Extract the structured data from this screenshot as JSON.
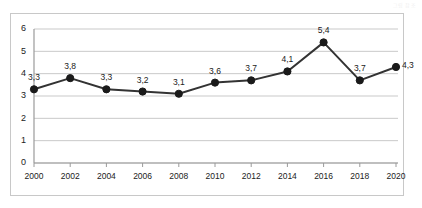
{
  "corner_note": {
    "text": "그림 참조"
  },
  "chart_data": {
    "type": "line",
    "title": "",
    "subtitle": "",
    "xlabel": "",
    "ylabel": "",
    "categories": [
      "2000",
      "2002",
      "2004",
      "2006",
      "2008",
      "2010",
      "2012",
      "2014",
      "2016",
      "2018",
      "2020"
    ],
    "values": [
      3.3,
      3.8,
      3.3,
      3.2,
      3.1,
      3.6,
      3.7,
      4.1,
      5.4,
      3.7,
      4.3
    ],
    "point_labels": [
      "3,3",
      "3,8",
      "3,3",
      "3,2",
      "3,1",
      "3,6",
      "3,7",
      "4,1",
      "5,4",
      "3,7",
      "4,3"
    ],
    "label_positions": [
      "above",
      "above",
      "above",
      "above",
      "above",
      "above",
      "above",
      "above",
      "above",
      "above",
      "right"
    ],
    "ylim": [
      0,
      6
    ],
    "ytick_values": [
      0,
      1,
      2,
      3,
      4,
      5,
      6
    ],
    "ytick_labels": [
      "0",
      "1",
      "2",
      "3",
      "4",
      "5",
      "6"
    ],
    "grid": true,
    "grid_axis": "y",
    "legend": false,
    "legend_position": "none",
    "series_name": "",
    "colors": {
      "line": "#333333",
      "marker": "#1a1a1a",
      "gridline": "#c9c9c9",
      "axis": "#9a9a9a",
      "frame": "#c8c8c8",
      "text": "#222222",
      "background": "#ffffff"
    }
  }
}
